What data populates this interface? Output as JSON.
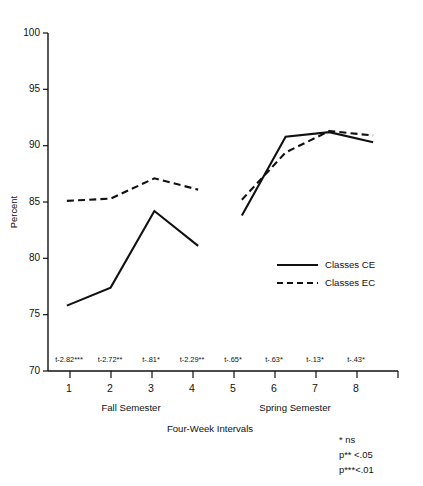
{
  "chart_data": {
    "type": "line",
    "title": "",
    "xlabel": "Four-Week Intervals",
    "ylabel": "Percent",
    "categories": [
      "1",
      "2",
      "3",
      "4",
      "5",
      "6",
      "7",
      "8"
    ],
    "ylim": [
      70,
      100
    ],
    "yticks": [
      70,
      75,
      80,
      85,
      90,
      95,
      100
    ],
    "ytick_labels": [
      "70",
      "75",
      "80",
      "85",
      "90",
      "95",
      "100"
    ],
    "grid": false,
    "legend_position": "center-right",
    "series": [
      {
        "name": "Classes CE",
        "style": "solid",
        "values": [
          75.8,
          77.4,
          84.2,
          81.1,
          83.8,
          90.8,
          91.2,
          90.3
        ],
        "break_after_index": 3
      },
      {
        "name": "Classes EC",
        "style": "dashed",
        "values": [
          85.1,
          85.3,
          87.1,
          86.1,
          85.2,
          89.4,
          91.3,
          90.9
        ],
        "break_after_index": 3
      }
    ],
    "group_labels": [
      {
        "label": "Fall Semester",
        "categories": [
          "1",
          "2",
          "3",
          "4"
        ]
      },
      {
        "label": "Spring Semester",
        "categories": [
          "5",
          "6",
          "7",
          "8"
        ]
      }
    ],
    "annotations": [
      "t-2.82***",
      "t-2.72**",
      "t-.81*",
      "t-2.29**",
      "t-.65*",
      "t-.63*",
      "t-.13*",
      "t-.43*"
    ],
    "footnotes": [
      "* ns",
      "p** <.05",
      "p***<.01"
    ]
  },
  "axes": {
    "y_title": "Percent",
    "x_title": "Four-Week Intervals"
  },
  "xticks": {
    "labels": [
      "1",
      "2",
      "3",
      "4",
      "5",
      "6",
      "7",
      "8"
    ]
  },
  "yticks": {
    "labels": [
      "100",
      "95",
      "90",
      "85",
      "80",
      "75",
      "70"
    ]
  },
  "tstats": {
    "values": [
      "t-2.82***",
      "t-2.72**",
      "t-.81*",
      "t-2.29**",
      "t-.65*",
      "t-.63*",
      "t-.13*",
      "t-.43*"
    ]
  },
  "groups": {
    "fall": "Fall Semester",
    "spring": "Spring Semester"
  },
  "legend": {
    "items": [
      {
        "label": "Classes CE",
        "style": "solid"
      },
      {
        "label": "Classes EC",
        "style": "dashed"
      }
    ],
    "ce_label": "Classes CE",
    "ec_label": "Classes EC"
  },
  "footnotes": {
    "line1": "* ns",
    "line2": "p** <.05",
    "line3": "p***<.01"
  },
  "colors": {
    "ink": "#111111",
    "background": "#ffffff"
  }
}
